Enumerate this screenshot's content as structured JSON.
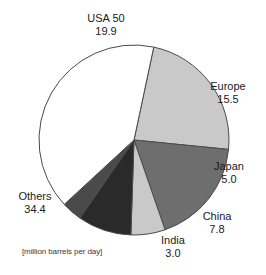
{
  "chart_data": {
    "type": "pie",
    "title": "",
    "subtitle": "",
    "xlabel": "",
    "ylabel": "",
    "unit_note": "[million barrels per day]",
    "legend_position": "callout-labels-outside",
    "grid": false,
    "total": 85.6,
    "categories": [
      "USA 50",
      "Europe",
      "Japan",
      "China",
      "India",
      "Others"
    ],
    "values": [
      19.9,
      15.5,
      5.0,
      7.8,
      3.0,
      34.4
    ],
    "slices": [
      {
        "label": "USA 50",
        "value": "19.9",
        "value_num": 19.9,
        "color": "#c9c9c9",
        "start_angle": 12,
        "sweep_angle": 83.7
      },
      {
        "label": "Europe",
        "value": "15.5",
        "value_num": 15.5,
        "color": "#6e6e6e",
        "start_angle": 95.7,
        "sweep_angle": 65.2
      },
      {
        "label": "Japan",
        "value": "5.0",
        "value_num": 5.0,
        "color": "#c9c9c9",
        "start_angle": 160.9,
        "sweep_angle": 21.0
      },
      {
        "label": "China",
        "value": "7.8",
        "value_num": 7.8,
        "color": "#2a2a2a",
        "start_angle": 181.9,
        "sweep_angle": 32.8
      },
      {
        "label": "India",
        "value": "3.0",
        "value_num": 3.0,
        "color": "#4a4a4a",
        "start_angle": 214.7,
        "sweep_angle": 12.6
      },
      {
        "label": "Others",
        "value": "34.4",
        "value_num": 34.4,
        "color": "#ffffff",
        "start_angle": 227.3,
        "sweep_angle": 144.7
      }
    ],
    "geometry": {
      "center_x": 134,
      "center_y": 140,
      "radius": 95
    },
    "stroke_color": "#4a4a4a"
  }
}
